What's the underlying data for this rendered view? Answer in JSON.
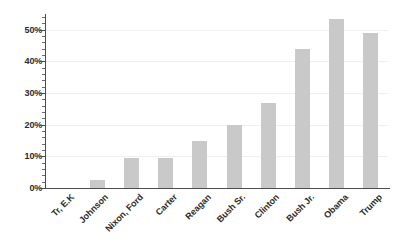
{
  "chart_data": {
    "type": "bar",
    "title": "",
    "subtitle": "",
    "xlabel": "",
    "ylabel": "",
    "categories": [
      "Tr, E.K",
      "Johnson",
      "Nixon, Ford",
      "Carter",
      "Reagan",
      "Bush Sr.",
      "Clinton",
      "Bush Jr.",
      "Obama",
      "Trump"
    ],
    "values": [
      0,
      2.5,
      9.5,
      9.5,
      15,
      20,
      27,
      44,
      53.5,
      49
    ],
    "value_unit": "%",
    "ylim": [
      0,
      55
    ],
    "ytick_labels": [
      "0%",
      "10%",
      "20%",
      "30%",
      "40%",
      "50%"
    ],
    "ytick_values": [
      0,
      10,
      20,
      30,
      40,
      50
    ],
    "minor_tick_interval": 2,
    "grid": true,
    "grid_axis": "y",
    "legend": null,
    "legend_position": "none",
    "bar_color": "#c9c9c9",
    "axis_color": "#4d4d4d",
    "grid_color": "#efefef",
    "text_color": "#2b2b2b",
    "background": "#ffffff"
  }
}
